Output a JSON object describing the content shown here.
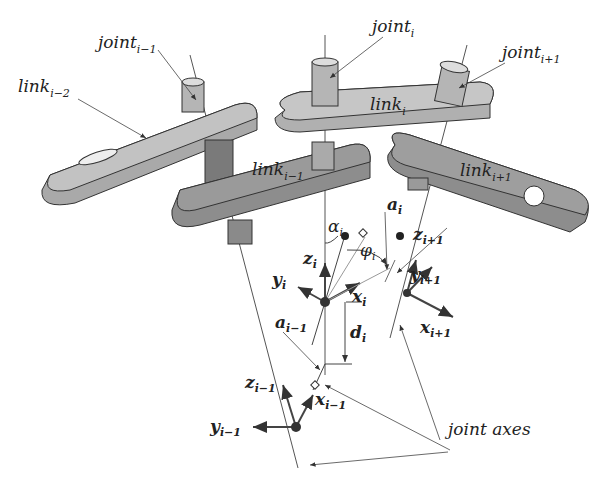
{
  "diagram": {
    "labels": {
      "joint_im1": {
        "base": "joint",
        "sub": "i−1"
      },
      "joint_i": {
        "base": "joint",
        "sub": "i"
      },
      "joint_ip1": {
        "base": "joint",
        "sub": "i+1"
      },
      "link_im2": {
        "base": "link",
        "sub": "i−2"
      },
      "link_im1": {
        "base": "link",
        "sub": "i−1"
      },
      "link_i": {
        "base": "link",
        "sub": "i"
      },
      "link_ip1": {
        "base": "link",
        "sub": "i+1"
      },
      "alpha_i": {
        "base": "α",
        "sub": "i"
      },
      "phi_i": {
        "base": "φ",
        "sub": "i"
      },
      "a_i": {
        "base": "a",
        "sub": "i"
      },
      "a_im1": {
        "base": "a",
        "sub": "i−1"
      },
      "z_i": {
        "base": "z",
        "sub": "i"
      },
      "z_ip1": {
        "base": "z",
        "sub": "i+1"
      },
      "z_im1": {
        "base": "z",
        "sub": "i−1"
      },
      "y_i": {
        "base": "y",
        "sub": "i"
      },
      "y_ip1": {
        "base": "y",
        "sub": "i+1"
      },
      "y_im1": {
        "base": "y",
        "sub": "i−1"
      },
      "x_i": {
        "base": "x",
        "sub": "i"
      },
      "x_ip1": {
        "base": "x",
        "sub": "i+1"
      },
      "x_im1": {
        "base": "x",
        "sub": "i−1"
      },
      "d_i": {
        "base": "d",
        "sub": "i"
      },
      "joint_axes": "joint axes"
    },
    "colors": {
      "link_light": "#b8b8b8",
      "link_dark": "#8a8a8a",
      "edge": "#333333",
      "line": "#444444"
    }
  }
}
